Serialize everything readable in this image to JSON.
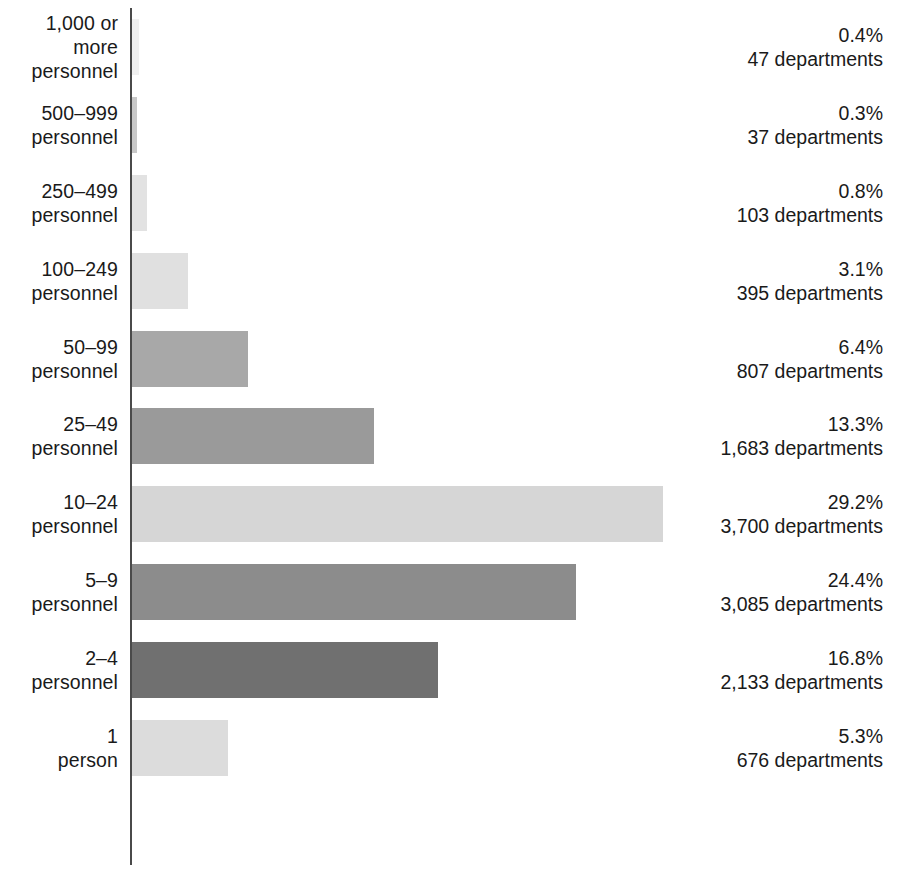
{
  "chart_data": {
    "type": "bar",
    "orientation": "horizontal",
    "title": "",
    "subtitle": "",
    "xlabel": "",
    "ylabel": "",
    "grid": false,
    "legend": null,
    "axis_line": true,
    "xlim": [
      0,
      32
    ],
    "value_unit": "percent",
    "count_unit": "departments",
    "categories": [
      "1,000 or more personnel",
      "500–999 personnel",
      "250–499 personnel",
      "100–249 personnel",
      "50–99 personnel",
      "25–49 personnel",
      "10–24 personnel",
      "5–9 personnel",
      "2–4 personnel",
      "1 person"
    ],
    "values": [
      0.4,
      0.3,
      0.8,
      3.1,
      6.4,
      13.3,
      29.2,
      24.4,
      16.8,
      5.3
    ],
    "counts": [
      47,
      37,
      103,
      395,
      807,
      1683,
      3700,
      3085,
      2133,
      676
    ]
  },
  "rows": [
    {
      "label_line1": "1,000 or more",
      "label_line2": "personnel",
      "percent_text": "0.4%",
      "count_text": "47 departments",
      "value": 0.4,
      "bar_color": "#f0f0f0"
    },
    {
      "label_line1": "500–999",
      "label_line2": "personnel",
      "percent_text": "0.3%",
      "count_text": "37 departments",
      "value": 0.3,
      "bar_color": "#c8c8c8"
    },
    {
      "label_line1": "250–499",
      "label_line2": "personnel",
      "percent_text": "0.8%",
      "count_text": "103 departments",
      "value": 0.8,
      "bar_color": "#e2e2e2"
    },
    {
      "label_line1": "100–249",
      "label_line2": "personnel",
      "percent_text": "3.1%",
      "count_text": "395 departments",
      "value": 3.1,
      "bar_color": "#e0e0e0"
    },
    {
      "label_line1": "50–99",
      "label_line2": "personnel",
      "percent_text": "6.4%",
      "count_text": "807 departments",
      "value": 6.4,
      "bar_color": "#a8a8a8"
    },
    {
      "label_line1": "25–49",
      "label_line2": "personnel",
      "percent_text": "13.3%",
      "count_text": "1,683 departments",
      "value": 13.3,
      "bar_color": "#9a9a9a"
    },
    {
      "label_line1": "10–24",
      "label_line2": "personnel",
      "percent_text": "29.2%",
      "count_text": "3,700 departments",
      "value": 29.2,
      "bar_color": "#d6d6d6"
    },
    {
      "label_line1": "5–9",
      "label_line2": "personnel",
      "percent_text": "24.4%",
      "count_text": "3,085 departments",
      "value": 24.4,
      "bar_color": "#8c8c8c"
    },
    {
      "label_line1": "2–4",
      "label_line2": "personnel",
      "percent_text": "16.8%",
      "count_text": "2,133 departments",
      "value": 16.8,
      "bar_color": "#707070"
    },
    {
      "label_line1": "1",
      "label_line2": "person",
      "percent_text": "5.3%",
      "count_text": "676 departments",
      "value": 5.3,
      "bar_color": "#dcdcdc"
    }
  ],
  "scale": {
    "pixels_per_percent": 18.2,
    "axis_x": 130
  },
  "colors": {
    "axis": "#4a4a4a",
    "text": "#1a1a1a",
    "background": "#ffffff"
  }
}
